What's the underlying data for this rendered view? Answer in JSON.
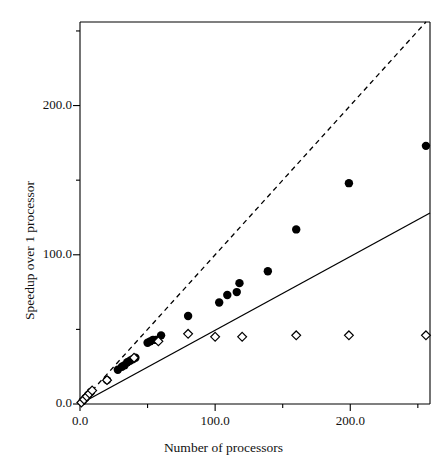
{
  "chart_data": {
    "type": "scatter",
    "title": "",
    "xlabel": "Number of processors",
    "ylabel": "Speedup over 1 processor",
    "xlim": [
      0,
      259
    ],
    "ylim": [
      0,
      256
    ],
    "xticks": [
      0,
      100,
      200
    ],
    "xticklabels": [
      "0.0",
      "100.0",
      "200.0"
    ],
    "xminorticks": [
      50,
      150,
      250
    ],
    "yticks": [
      0,
      100,
      200
    ],
    "yticklabels": [
      "0.0",
      "100.0",
      "200.0"
    ],
    "yminorticks": [
      50,
      150,
      250
    ],
    "grid": false,
    "legend": "none",
    "series": [
      {
        "name": "measured speedup",
        "marker": "filled-circle",
        "color": "#000000",
        "points": [
          [
            2,
            2
          ],
          [
            4,
            4
          ],
          [
            6,
            6
          ],
          [
            8,
            8
          ],
          [
            20,
            16
          ],
          [
            28,
            23
          ],
          [
            31,
            25
          ],
          [
            33,
            26
          ],
          [
            35,
            28
          ],
          [
            37,
            29
          ],
          [
            39,
            30
          ],
          [
            41,
            31
          ],
          [
            50,
            41
          ],
          [
            52,
            42
          ],
          [
            54,
            43
          ],
          [
            56,
            43
          ],
          [
            60,
            46
          ],
          [
            80,
            59
          ],
          [
            103,
            68
          ],
          [
            109,
            73
          ],
          [
            116,
            75
          ],
          [
            118,
            81
          ],
          [
            139,
            89
          ],
          [
            160,
            117
          ],
          [
            199,
            148
          ],
          [
            256,
            173
          ]
        ]
      },
      {
        "name": "fixed-work efficiency",
        "marker": "open-diamond",
        "color": "#000000",
        "points": [
          [
            1,
            1
          ],
          [
            3,
            3
          ],
          [
            5,
            5
          ],
          [
            7,
            7
          ],
          [
            9,
            9
          ],
          [
            20,
            16
          ],
          [
            40,
            31
          ],
          [
            58,
            42
          ],
          [
            80,
            47
          ],
          [
            100,
            45
          ],
          [
            120,
            45
          ],
          [
            160,
            46
          ],
          [
            199,
            46
          ],
          [
            256,
            46
          ]
        ]
      }
    ],
    "lines": [
      {
        "name": "linear-speedup-reference",
        "style": "dashed",
        "color": "#000000",
        "from": [
          0,
          0
        ],
        "to": [
          256,
          256
        ]
      },
      {
        "name": "half-linear-reference",
        "style": "solid",
        "color": "#000000",
        "from": [
          0,
          0
        ],
        "to": [
          259,
          128
        ]
      }
    ]
  }
}
